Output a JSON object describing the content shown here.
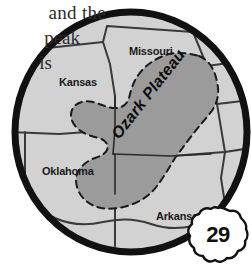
{
  "page": {
    "body_text_lines": [
      "and the",
      "peak",
      "is"
    ],
    "page_number": "29"
  },
  "map": {
    "title": "Ozark Plateau regional map",
    "region_label": "Ozark Plateau",
    "states": [
      {
        "name": "Missouri"
      },
      {
        "name": "Kansas"
      },
      {
        "name": "Oklahoma"
      },
      {
        "name": "Arkansas"
      }
    ],
    "colors": {
      "state_fill": "#d2d2d2",
      "plateau_fill": "#9b9b9b",
      "border_outline": "#111111",
      "state_line": "#3a3a3a",
      "background": "#ffffff",
      "badge_fill": "#ffffff",
      "text": "#1a1a1a"
    }
  }
}
